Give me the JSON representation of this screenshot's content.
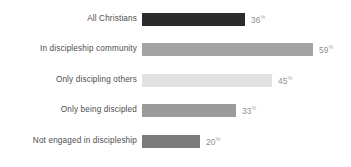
{
  "chart_data": {
    "type": "bar",
    "orientation": "horizontal",
    "title": "",
    "subtitle": "",
    "xlabel": "",
    "ylabel": "",
    "grid": false,
    "legend": null,
    "value_suffix": "%",
    "xlim": [
      0,
      100
    ],
    "categories": [
      "All Christians",
      "In discipleship community",
      "Only discipling others",
      "Only being discipled",
      "Not engaged in discipleship"
    ],
    "values": [
      36,
      59,
      45,
      33,
      20
    ],
    "value_labels": [
      "36",
      "59",
      "45",
      "33",
      "20"
    ],
    "bar_colors": [
      "#2b2b2b",
      "#a3a3a3",
      "#e2e2e2",
      "#9b9b9b",
      "#7a7a7a"
    ],
    "bars": [
      {
        "label": "All Christians",
        "value": 36,
        "value_label": "36",
        "suffix": "%",
        "color": "#2b2b2b",
        "width_px": 103
      },
      {
        "label": "In discipleship community",
        "value": 59,
        "value_label": "59",
        "suffix": "%",
        "color": "#a3a3a3",
        "width_px": 171
      },
      {
        "label": "Only discipling others",
        "value": 45,
        "value_label": "45",
        "suffix": "%",
        "color": "#e2e2e2",
        "width_px": 130
      },
      {
        "label": "Only being discipled",
        "value": 33,
        "value_label": "33",
        "suffix": "%",
        "color": "#9b9b9b",
        "width_px": 94
      },
      {
        "label": "Not engaged in discipleship",
        "value": 20,
        "value_label": "20",
        "suffix": "%",
        "color": "#7a7a7a",
        "width_px": 58
      }
    ]
  },
  "style": {
    "background": "#ffffff",
    "label_color": "#4d4d4d",
    "value_color": "#8f8f8f"
  },
  "layout": {
    "row_tops_px": [
      11,
      41,
      72,
      102,
      133
    ]
  }
}
